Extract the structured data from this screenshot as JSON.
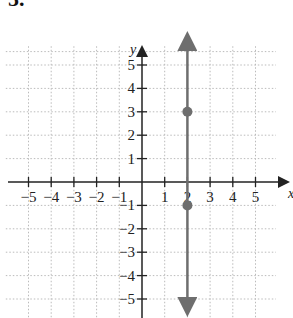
{
  "problem_number": "5.",
  "chart_data": {
    "type": "line",
    "title": "",
    "xlabel": "x",
    "ylabel": "y",
    "xlim": [
      -6,
      6.5
    ],
    "ylim": [
      -6,
      6
    ],
    "xticks": [
      -5,
      -4,
      -3,
      -2,
      -1,
      1,
      2,
      3,
      4,
      5
    ],
    "yticks": [
      -5,
      -4,
      -3,
      -2,
      -1,
      1,
      2,
      3,
      4,
      5
    ],
    "grid": true,
    "series": [
      {
        "name": "vertical line x = 2",
        "x": [
          2,
          2
        ],
        "y": [
          -6,
          6
        ],
        "arrows": "both",
        "color": "#6e6e6e"
      }
    ],
    "points": [
      {
        "x": 2,
        "y": 3
      },
      {
        "x": 2,
        "y": -1
      }
    ]
  }
}
